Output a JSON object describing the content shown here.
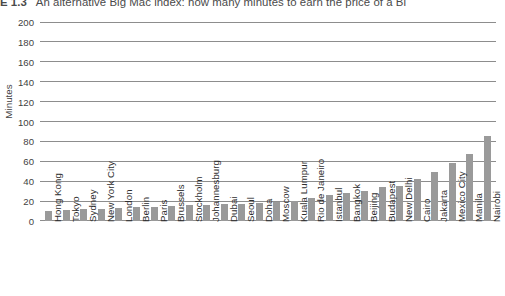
{
  "figure": {
    "number": "E 1.3",
    "title": "An alternative Big Mac index: how many minutes to earn the price of a Bi"
  },
  "axes": {
    "ylabel": "Minutes",
    "xlabel": ""
  },
  "chart_data": {
    "type": "bar",
    "title": "An alternative Big Mac index: how many minutes to earn the price of a Bi",
    "xlabel": "",
    "ylabel": "Minutes",
    "ylim": [
      0,
      200
    ],
    "yticks": [
      0,
      20,
      40,
      60,
      80,
      100,
      120,
      140,
      160,
      180,
      200
    ],
    "grid": true,
    "legend": "none",
    "bar_color": "#9a9a9a",
    "categories": [
      "Hong Kong",
      "Tokyo",
      "Sydney",
      "New York City",
      "London",
      "Berlin",
      "Paris",
      "Brussels",
      "Stockholm",
      "Johannesburg",
      "Dubai",
      "Seoul",
      "Doha",
      "Moscow",
      "Kuala Lumpur",
      "Rio de Janeiro",
      "Istanbul",
      "Bangkok",
      "Beijing",
      "Budapest",
      "New Delhi",
      "Cairo",
      "Jakarta",
      "Mexico City",
      "Manila",
      "Nairobi"
    ],
    "values": [
      10,
      11,
      12,
      12,
      13,
      14,
      14,
      15,
      16,
      16,
      17,
      17,
      18,
      19,
      20,
      23,
      26,
      28,
      30,
      34,
      35,
      42,
      49,
      58,
      67,
      85
    ]
  }
}
